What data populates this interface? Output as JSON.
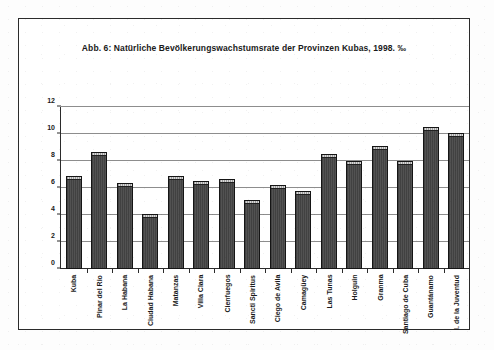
{
  "figure": {
    "title": "Abb. 6: Natürliche Bevölkerungswachstumsrate der Provinzen Kubas, 1998. ‰",
    "frame_color": "#2b2b2b",
    "background": "#ffffff",
    "bar_color": "#4a4a4a",
    "gridline_color": "#8d8d8d"
  },
  "chart_data": {
    "type": "bar",
    "title": "Abb. 6: Natürliche Bevölkerungswachstumsrate der Provinzen Kubas, 1998. ‰",
    "xlabel": "",
    "ylabel": "",
    "unit": "‰",
    "ylim": [
      0,
      12
    ],
    "yticks": [
      0,
      2,
      4,
      6,
      8,
      10,
      12
    ],
    "ytick_labels": [
      "0",
      "2",
      "4",
      "6",
      "8",
      "10",
      "12"
    ],
    "grid": true,
    "legend": false,
    "series_name": "Natürliche Bevölkerungswachstumsrate 1998",
    "categories": [
      "Kuba",
      "Pinar del Rio",
      "La Habana",
      "Ciudad Habana",
      "Matanzas",
      "Villa Clara",
      "Cienfuegos",
      "Sancti Spiritus",
      "Ciego de Avila",
      "Camagüey",
      "Las Tunas",
      "Holguin",
      "Granma",
      "Santiago de Cuba",
      "Guantánamo",
      "I. de la Juventud"
    ],
    "values": [
      6.9,
      8.7,
      6.4,
      4.1,
      6.9,
      6.5,
      6.7,
      5.1,
      6.2,
      5.8,
      8.5,
      8.0,
      9.1,
      8.0,
      10.5,
      10.1
    ]
  }
}
